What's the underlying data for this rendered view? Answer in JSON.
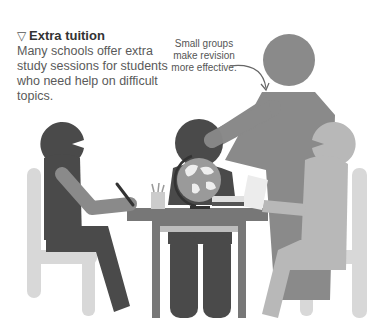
{
  "caption": {
    "icon": "down-triangle-icon",
    "title": "Extra tuition",
    "body": "Many schools offer extra study sessions for students who need help on difficult topics."
  },
  "annotation": {
    "text": "Small groups make revision more effective."
  },
  "colors": {
    "dark": "#4a4a4a",
    "mid": "#8a8a8a",
    "light": "#b8b8b8",
    "lighter": "#d4d4d4",
    "table": "#777777"
  }
}
